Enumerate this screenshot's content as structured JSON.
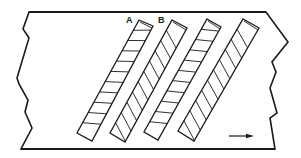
{
  "diagram": {
    "type": "strip-with-diagonal-bands",
    "colors": {
      "line": "#1a1a1a",
      "background": "#ffffff"
    },
    "plate": {
      "outline": "M29,12 L266,12 L288,42 L272,62 L276,72 L270,88 L277,113 L270,118 L275,149 L21,149 L32,128 L25,112 L28,100 L19,84 L17,78 L29,38 L23,29 Z"
    },
    "stripes": [
      {
        "id": "stripe-1",
        "label": "A",
        "hatch": "horizontal",
        "corners": [
          [
            139,
            20
          ],
          [
            153,
            26
          ],
          [
            92,
            141
          ],
          [
            77,
            133
          ]
        ]
      },
      {
        "id": "stripe-2",
        "label": "B",
        "hatch": "diagonal",
        "corners": [
          [
            172,
            20
          ],
          [
            187,
            28
          ],
          [
            125,
            142
          ],
          [
            110,
            133
          ]
        ]
      },
      {
        "id": "stripe-3",
        "label": "",
        "hatch": "horizontal",
        "corners": [
          [
            207,
            19
          ],
          [
            221,
            27
          ],
          [
            158,
            140
          ],
          [
            144,
            132
          ]
        ]
      },
      {
        "id": "stripe-4",
        "label": "",
        "hatch": "diagonal",
        "corners": [
          [
            243,
            19
          ],
          [
            259,
            28
          ],
          [
            194,
            141
          ],
          [
            178,
            131
          ]
        ]
      }
    ],
    "labels": [
      {
        "text": "A",
        "x": 126,
        "y": 23
      },
      {
        "text": "B",
        "x": 158,
        "y": 23
      }
    ],
    "arrow": {
      "direction": "right",
      "x1": 229,
      "y1": 136,
      "x2": 254,
      "y2": 136
    }
  }
}
